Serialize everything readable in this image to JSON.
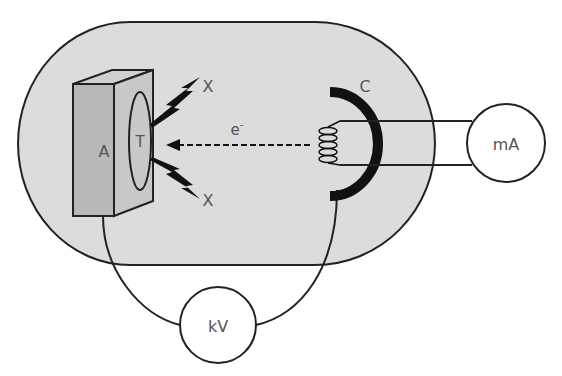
{
  "diagram": {
    "labels": {
      "anode": "A",
      "target": "T",
      "cathode": "C",
      "electron": "e",
      "electron_charge": "-",
      "xray_top": "X",
      "xray_bottom": "X",
      "milliammeter": "mA",
      "kilovoltmeter": "kV"
    },
    "colors": {
      "envelope_fill": "#dcdcdc",
      "anode_front": "#b8b8b8",
      "anode_side": "#c8c8c8",
      "anode_top": "#d0d0d0",
      "stroke": "#222222",
      "cathode_cup": "#111111",
      "text": "#555555"
    }
  }
}
